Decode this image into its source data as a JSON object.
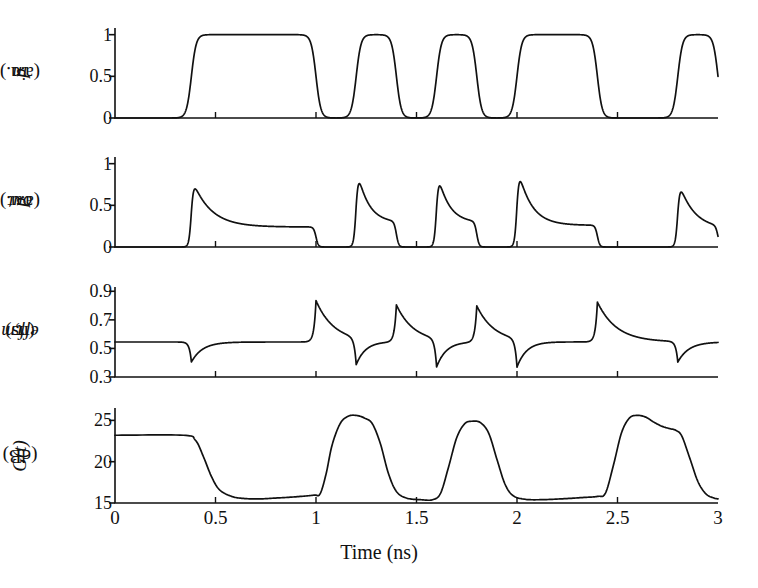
{
  "figure": {
    "background": "#ffffff",
    "line_color": "#111111",
    "axis_color": "#111111"
  },
  "axes": {
    "x": {
      "label": "Time (ns)",
      "min": 0,
      "max": 3,
      "ticks": [
        0,
        0.5,
        1,
        1.5,
        2,
        2.5,
        3
      ],
      "ticklabels": [
        "0",
        "0.5",
        "1",
        "1.5",
        "2",
        "2.5",
        "3"
      ]
    }
  },
  "panels": [
    {
      "id": "p-in",
      "ylabel_main": "p",
      "ylabel_sub": "in",
      "ylabel_unit": " (a.u.)",
      "ylim": [
        0,
        1.08
      ],
      "ticks": [
        0,
        0.5,
        1
      ],
      "ticklabels": [
        "0",
        "0.5",
        "1"
      ]
    },
    {
      "id": "p-out",
      "ylabel_main": "p",
      "ylabel_sub": "out",
      "ylabel_unit": " (a.u.)",
      "ylim": [
        0,
        1.08
      ],
      "ticks": [
        0,
        0.5,
        1
      ],
      "ticklabels": [
        "0",
        "0.5",
        "1"
      ]
    },
    {
      "id": "tau-eff",
      "ylabel_main": "τ",
      "ylabel_sub": "eff,m",
      "ylabel_unit": " (ns)",
      "ylim": [
        0.3,
        0.93
      ],
      "ticks": [
        0.3,
        0.5,
        0.7,
        0.9
      ],
      "ticklabels": [
        "0.3",
        "0.5",
        "0.7",
        "0.9"
      ]
    },
    {
      "id": "gain",
      "ylabel_main": "G(t)",
      "ylabel_sub": "",
      "ylabel_unit": " (dB)",
      "ylim": [
        15,
        26.5
      ],
      "ticks": [
        15,
        20,
        25
      ],
      "ticklabels": [
        "15",
        "20",
        "25"
      ]
    }
  ],
  "chart_data": {
    "type": "line",
    "title": "",
    "xlabel": "Time (ns)",
    "xlim": [
      0,
      3
    ],
    "grid": false,
    "legend": false,
    "subplots": [
      {
        "name": "p_in",
        "ylabel": "p_in (a.u.)",
        "ylim": [
          0,
          1.08
        ],
        "yticks": [
          0,
          0.5,
          1
        ],
        "description": "Input optical power: rectangular NRZ bit pattern, amplitude 0 to 1",
        "pulses": [
          {
            "start": 0.38,
            "end": 1.0
          },
          {
            "start": 1.2,
            "end": 1.4
          },
          {
            "start": 1.6,
            "end": 1.8
          },
          {
            "start": 2.0,
            "end": 2.4
          },
          {
            "start": 2.8,
            "end": 3.0
          }
        ],
        "low": 0.0,
        "high": 1.0,
        "edge_risetime": 0.012
      },
      {
        "name": "p_out",
        "ylabel": "p_out (a.u.)",
        "ylim": [
          0,
          1.08
        ],
        "yticks": [
          0,
          0.5,
          1
        ],
        "description": "Output power: sharp leading-edge spike then exponential decay to a plateau set by the saturated gain",
        "low": 0.0,
        "pulse_response": [
          {
            "start": 0.38,
            "end": 1.0,
            "peak": 0.84,
            "plateau": 0.24,
            "decay_ns": 0.09
          },
          {
            "start": 1.2,
            "end": 1.4,
            "peak": 0.99,
            "plateau": 0.29,
            "decay_ns": 0.055
          },
          {
            "start": 1.6,
            "end": 1.8,
            "peak": 0.95,
            "plateau": 0.29,
            "decay_ns": 0.055
          },
          {
            "start": 2.0,
            "end": 2.4,
            "peak": 1.0,
            "plateau": 0.26,
            "decay_ns": 0.065
          },
          {
            "start": 2.8,
            "end": 3.0,
            "peak": 0.82,
            "plateau": 0.215,
            "decay_ns": 0.075
          }
        ]
      },
      {
        "name": "tau_eff_m",
        "ylabel": "tau_eff,m (ns)",
        "ylim": [
          0.3,
          0.93
        ],
        "yticks": [
          0.3,
          0.5,
          0.7,
          0.9
        ],
        "description": "Effective carrier lifetime: dips sharply at each rising edge, spikes upward at each falling edge, relaxing to baseline",
        "baseline": 0.545,
        "events": [
          {
            "time": 0.38,
            "type": "dip",
            "extreme": 0.405,
            "relax_ns": 0.055
          },
          {
            "time": 1.0,
            "type": "spike",
            "extreme": 0.835,
            "relax_ns": 0.09
          },
          {
            "time": 1.2,
            "type": "dip",
            "extreme": 0.355,
            "relax_ns": 0.05
          },
          {
            "time": 1.4,
            "type": "spike",
            "extreme": 0.805,
            "relax_ns": 0.085
          },
          {
            "time": 1.6,
            "type": "dip",
            "extreme": 0.345,
            "relax_ns": 0.05
          },
          {
            "time": 1.8,
            "type": "spike",
            "extreme": 0.8,
            "relax_ns": 0.085
          },
          {
            "time": 2.0,
            "type": "dip",
            "extreme": 0.345,
            "relax_ns": 0.05
          },
          {
            "time": 2.4,
            "type": "spike",
            "extreme": 0.825,
            "relax_ns": 0.095
          },
          {
            "time": 2.8,
            "type": "dip",
            "extreme": 0.4,
            "relax_ns": 0.055
          }
        ]
      },
      {
        "name": "G_t",
        "ylabel": "G(t) (dB)",
        "ylim": [
          15,
          26.5
        ],
        "yticks": [
          15,
          20,
          25
        ],
        "description": "Instantaneous SOA gain in dB: saturates down during each mark, recovers between marks with overshoot toward the unsaturated value",
        "unsaturated_start": 23.2,
        "points": [
          [
            0.0,
            23.2
          ],
          [
            0.34,
            23.2
          ],
          [
            0.4,
            22.6
          ],
          [
            0.44,
            20.6
          ],
          [
            0.48,
            18.2
          ],
          [
            0.52,
            16.6
          ],
          [
            0.58,
            15.8
          ],
          [
            0.64,
            15.55
          ],
          [
            0.72,
            15.5
          ],
          [
            0.8,
            15.6
          ],
          [
            0.9,
            15.75
          ],
          [
            0.99,
            15.95
          ],
          [
            1.02,
            16.1
          ],
          [
            1.05,
            18.5
          ],
          [
            1.08,
            22.0
          ],
          [
            1.12,
            24.6
          ],
          [
            1.16,
            25.5
          ],
          [
            1.2,
            25.6
          ],
          [
            1.24,
            25.3
          ],
          [
            1.28,
            24.6
          ],
          [
            1.32,
            22.2
          ],
          [
            1.36,
            18.6
          ],
          [
            1.4,
            16.4
          ],
          [
            1.45,
            15.6
          ],
          [
            1.52,
            15.4
          ],
          [
            1.58,
            15.4
          ],
          [
            1.62,
            16.2
          ],
          [
            1.66,
            19.4
          ],
          [
            1.7,
            22.9
          ],
          [
            1.74,
            24.6
          ],
          [
            1.78,
            24.9
          ],
          [
            1.82,
            24.7
          ],
          [
            1.86,
            23.4
          ],
          [
            1.9,
            20.3
          ],
          [
            1.94,
            17.3
          ],
          [
            1.98,
            15.9
          ],
          [
            2.04,
            15.45
          ],
          [
            2.12,
            15.4
          ],
          [
            2.22,
            15.5
          ],
          [
            2.32,
            15.65
          ],
          [
            2.4,
            15.8
          ],
          [
            2.44,
            16.2
          ],
          [
            2.48,
            19.6
          ],
          [
            2.52,
            23.5
          ],
          [
            2.56,
            25.3
          ],
          [
            2.6,
            25.6
          ],
          [
            2.64,
            25.4
          ],
          [
            2.68,
            24.8
          ],
          [
            2.72,
            24.3
          ],
          [
            2.76,
            24.0
          ],
          [
            2.79,
            23.8
          ],
          [
            2.82,
            23.1
          ],
          [
            2.86,
            20.4
          ],
          [
            2.9,
            17.6
          ],
          [
            2.94,
            16.1
          ],
          [
            2.98,
            15.6
          ],
          [
            3.0,
            15.5
          ]
        ]
      }
    ]
  }
}
